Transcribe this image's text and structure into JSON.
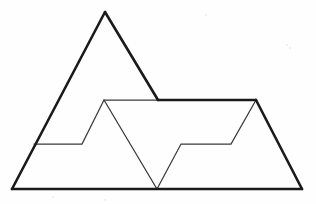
{
  "figure": {
    "background_color": "#fefefe",
    "stroke_color_thick": "#1a1a1a",
    "stroke_color_thin": "#3a3a3a",
    "stroke_width_thick": 2.6,
    "stroke_width_thin": 1.25,
    "width": 316,
    "height": 204
  },
  "chart_data": {
    "type": "line",
    "xlabel": "",
    "ylabel": "",
    "grid": false,
    "legend": "none",
    "xlim": [
      0,
      316
    ],
    "ylim": [
      204,
      0
    ],
    "series": [
      {
        "name": "large-triangle-left-slope",
        "weight": "thick",
        "closed": false,
        "points": [
          [
            12,
            189
          ],
          [
            105,
            12
          ]
        ]
      },
      {
        "name": "large-triangle-right-slope",
        "weight": "thick",
        "closed": false,
        "points": [
          [
            105,
            12
          ],
          [
            158,
            100
          ]
        ]
      },
      {
        "name": "mountain-top-ridge",
        "weight": "thick",
        "closed": false,
        "points": [
          [
            158,
            100
          ],
          [
            256,
            100
          ]
        ]
      },
      {
        "name": "right-peak-descending-slope",
        "weight": "thick",
        "closed": false,
        "points": [
          [
            256,
            100
          ],
          [
            302,
            189
          ]
        ]
      },
      {
        "name": "baseline",
        "weight": "thick",
        "closed": false,
        "points": [
          [
            12,
            189
          ],
          [
            302,
            189
          ]
        ]
      },
      {
        "name": "inner-zigzag-path",
        "weight": "thin",
        "closed": false,
        "points": [
          [
            34,
            144
          ],
          [
            82,
            144
          ],
          [
            104,
            100
          ],
          [
            157,
            189
          ],
          [
            181,
            144
          ],
          [
            231,
            144
          ],
          [
            256,
            100
          ]
        ]
      },
      {
        "name": "inner-ridge-segment",
        "weight": "thin",
        "closed": false,
        "points": [
          [
            104,
            100
          ],
          [
            158,
            100
          ]
        ]
      }
    ],
    "vertices": [
      {
        "name": "large-triangle-apex",
        "x": 105,
        "y": 12
      },
      {
        "name": "bottom-left-corner",
        "x": 12,
        "y": 189
      },
      {
        "name": "bottom-right-corner",
        "x": 302,
        "y": 189
      },
      {
        "name": "left-slope-ledge-start",
        "x": 34,
        "y": 144
      },
      {
        "name": "left-ledge-end",
        "x": 82,
        "y": 144
      },
      {
        "name": "inner-left-peak",
        "x": 104,
        "y": 100
      },
      {
        "name": "ridge-left-junction",
        "x": 158,
        "y": 100
      },
      {
        "name": "valley-bottom",
        "x": 157,
        "y": 189
      },
      {
        "name": "right-ledge-start",
        "x": 181,
        "y": 144
      },
      {
        "name": "right-ledge-end",
        "x": 231,
        "y": 144
      },
      {
        "name": "right-peak",
        "x": 256,
        "y": 100
      }
    ]
  },
  "specks": [
    {
      "x": 286,
      "y": 44,
      "size": 2
    },
    {
      "x": 289,
      "y": 47,
      "size": 2
    },
    {
      "x": 52,
      "y": 196,
      "size": 2
    },
    {
      "x": 104,
      "y": 199,
      "size": 2
    },
    {
      "x": 205,
      "y": 14,
      "size": 2
    }
  ]
}
